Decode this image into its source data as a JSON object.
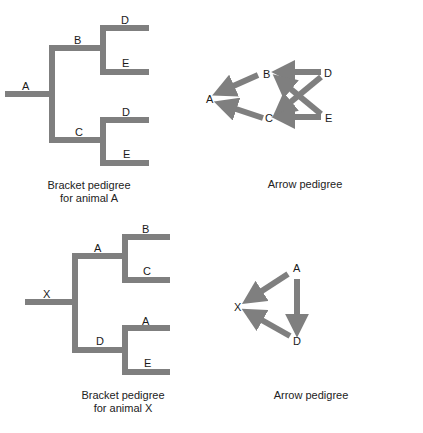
{
  "figure": {
    "colors": {
      "line": "#7f7f7f",
      "text": "#1a1a1a",
      "background": "#ffffff"
    },
    "panels": [
      {
        "id": "bracket-a",
        "type": "bracket-pedigree",
        "caption_line1": "Bracket pedigree",
        "caption_line2": "for animal A",
        "labels": {
          "root": "A",
          "sire": "B",
          "dam": "C",
          "sire_sire": "D",
          "sire_dam": "E",
          "dam_sire": "D",
          "dam_dam": "E"
        }
      },
      {
        "id": "arrow-a",
        "type": "arrow-pedigree",
        "caption": "Arrow pedigree",
        "nodes": {
          "a": "A",
          "b": "B",
          "c": "C",
          "d": "D",
          "e": "E"
        },
        "edges": [
          [
            "B",
            "A"
          ],
          [
            "C",
            "A"
          ],
          [
            "D",
            "B"
          ],
          [
            "E",
            "B"
          ],
          [
            "D",
            "C"
          ],
          [
            "E",
            "C"
          ]
        ]
      },
      {
        "id": "bracket-x",
        "type": "bracket-pedigree",
        "caption_line1": "Bracket pedigree",
        "caption_line2": "for animal X",
        "labels": {
          "root": "X",
          "sire": "A",
          "dam": "D",
          "sire_sire": "B",
          "sire_dam": "C",
          "dam_sire": "A",
          "dam_dam": "E"
        }
      },
      {
        "id": "arrow-x",
        "type": "arrow-pedigree",
        "caption": "Arrow pedigree",
        "nodes": {
          "a": "A",
          "x": "X",
          "d": "D"
        },
        "edges": [
          [
            "A",
            "X"
          ],
          [
            "D",
            "X"
          ],
          [
            "A",
            "D"
          ]
        ]
      }
    ]
  }
}
